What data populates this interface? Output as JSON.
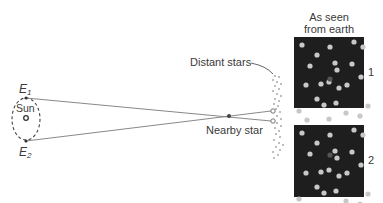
{
  "figure": {
    "labels": {
      "e1": "E",
      "e1_sub": "1",
      "e2": "E",
      "e2_sub": "2",
      "sun": "Sun",
      "distant_stars": "Distant stars",
      "nearby_star": "Nearby star",
      "panel_header_line1": "As seen",
      "panel_header_line2": "from earth",
      "panel1_number": "1",
      "panel2_number": "2"
    },
    "colors": {
      "panel_bg": "#1e1e1e",
      "star_dot": "#c8c8c8",
      "line": "#6a6a6a",
      "text": "#3a3a3a"
    },
    "panels": [
      {
        "id": 1,
        "nearby_star": [
          126,
          76
        ],
        "stars": [
          [
            8,
            8
          ],
          [
            23,
            18
          ],
          [
            36,
            10
          ],
          [
            60,
            5
          ],
          [
            69,
            10
          ],
          [
            16,
            29
          ],
          [
            41,
            26
          ],
          [
            58,
            27
          ],
          [
            12,
            48
          ],
          [
            27,
            47
          ],
          [
            35,
            45
          ],
          [
            45,
            51
          ],
          [
            42,
            66
          ],
          [
            53,
            48
          ],
          [
            67,
            40
          ],
          [
            23,
            62
          ],
          [
            13,
            83
          ],
          [
            35,
            82
          ],
          [
            52,
            76
          ],
          [
            66,
            79
          ],
          [
            5,
            74
          ],
          [
            74,
            69
          ],
          [
            30,
            68
          ],
          [
            43,
            33
          ]
        ]
      },
      {
        "id": 2,
        "nearby_star": [
          126,
          152
        ],
        "stars": [
          [
            8,
            8
          ],
          [
            23,
            18
          ],
          [
            36,
            10
          ],
          [
            60,
            5
          ],
          [
            69,
            10
          ],
          [
            16,
            29
          ],
          [
            41,
            26
          ],
          [
            58,
            27
          ],
          [
            12,
            48
          ],
          [
            27,
            47
          ],
          [
            35,
            45
          ],
          [
            45,
            51
          ],
          [
            42,
            66
          ],
          [
            53,
            48
          ],
          [
            67,
            40
          ],
          [
            23,
            62
          ],
          [
            13,
            83
          ],
          [
            35,
            82
          ],
          [
            52,
            76
          ],
          [
            66,
            79
          ],
          [
            5,
            74
          ],
          [
            74,
            69
          ],
          [
            30,
            68
          ],
          [
            43,
            33
          ]
        ]
      }
    ]
  }
}
